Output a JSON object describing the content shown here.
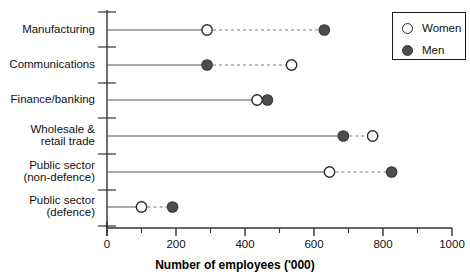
{
  "chart_data": {
    "type": "scatter",
    "subtype": "dumbbell",
    "title": "",
    "xlabel": "Number of employees ('000)",
    "ylabel": "",
    "xlim": [
      0,
      1000
    ],
    "xticks": [
      0,
      200,
      400,
      600,
      800,
      1000
    ],
    "xtick_labels": [
      "0",
      "200",
      "400",
      "600",
      "800",
      "1000"
    ],
    "minor_tick_step": 100,
    "grid": false,
    "legend_position": "top-right",
    "categories": [
      "Manufacturing",
      "Communications",
      "Finance/banking",
      "Wholesale &\nretail trade",
      "Public sector\n(non-defence)",
      "Public sector\n(defence)"
    ],
    "series": [
      {
        "name": "Women",
        "marker": "open-circle",
        "color": "#ffffff",
        "edge_color": "#2a2a2a",
        "values": [
          290,
          535,
          435,
          770,
          645,
          100
        ]
      },
      {
        "name": "Men",
        "marker": "filled-circle",
        "color": "#4d4d4d",
        "edge_color": "#3d3d3d",
        "values": [
          630,
          290,
          465,
          685,
          825,
          190
        ]
      }
    ],
    "legend_entries": [
      {
        "label": "Women",
        "marker": "open-circle"
      },
      {
        "label": "Men",
        "marker": "filled-circle"
      }
    ],
    "colors": {
      "axis": "#333333",
      "connector_solid": "#555555",
      "connector_dashed": "#777777",
      "text": "#111111"
    }
  }
}
